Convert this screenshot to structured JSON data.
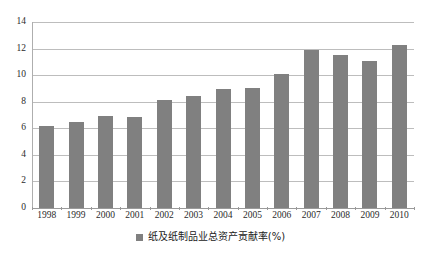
{
  "chart_data": {
    "type": "bar",
    "title": "",
    "subtitle": "",
    "xlabel": "",
    "ylabel": "",
    "categories": [
      "1998",
      "1999",
      "2000",
      "2001",
      "2002",
      "2003",
      "2004",
      "2005",
      "2006",
      "2007",
      "2008",
      "2009",
      "2010"
    ],
    "values": [
      6.15,
      6.5,
      6.9,
      6.85,
      8.15,
      8.45,
      8.95,
      9.0,
      10.1,
      11.9,
      11.55,
      11.1,
      12.3
    ],
    "series": [
      {
        "name": "纸及纸制品业总资产贡献率(%)",
        "values": [
          6.15,
          6.5,
          6.9,
          6.85,
          8.15,
          8.45,
          8.95,
          9.0,
          10.1,
          11.9,
          11.55,
          11.1,
          12.3
        ],
        "color": "#808080"
      }
    ],
    "ylim": [
      0,
      14
    ],
    "yticks": [
      0,
      2,
      4,
      6,
      8,
      10,
      12,
      14
    ],
    "ytick_labels": [
      "0",
      "2",
      "4",
      "6",
      "8",
      "10",
      "12",
      "14"
    ],
    "grid": true,
    "grid_axis": "y",
    "legend": {
      "position": "bottom",
      "entries": [
        {
          "label": "纸及纸制品业总资产贡献率(%)",
          "color": "#808080"
        }
      ]
    },
    "bar_color": "#808080",
    "gridline_color": "#bdbdbd",
    "axis_color": "#9a9a9a",
    "background": "#ffffff"
  }
}
